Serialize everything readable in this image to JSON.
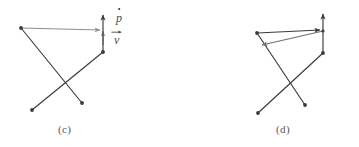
{
  "figure": {
    "background_color": "#ffffff",
    "panels": [
      {
        "id": "c",
        "caption": "(c)",
        "line_color": "#3a3a3e",
        "accent_color": "#8d8d92",
        "labels": [
          {
            "name": "p-dot",
            "base": "p",
            "accent": "dot",
            "x": 116,
            "y": 12
          },
          {
            "name": "v-vector",
            "base": "v",
            "accent": "arrow",
            "x": 114,
            "y": 34
          }
        ],
        "vertices": [
          {
            "name": "top-left-vertex",
            "x": 21,
            "y": 28
          },
          {
            "name": "right-mid-vertex",
            "x": 103,
            "y": 52
          },
          {
            "name": "lower-left-endpoint",
            "x": 32,
            "y": 110
          },
          {
            "name": "lower-right-endpoint",
            "x": 82,
            "y": 103
          },
          {
            "name": "arrow-origin",
            "x": 103,
            "y": 32
          }
        ],
        "arrows": [
          {
            "name": "horizontal-momentum-arrow",
            "from_x": 21,
            "from_y": 28,
            "to_x": 104,
            "to_y": 30,
            "color": "#8d8d92"
          },
          {
            "name": "vertical-velocity-arrow",
            "from_x": 103,
            "from_y": 52,
            "to_x": 103,
            "to_y": 11,
            "color": "#3a3a3e"
          },
          {
            "name": "short-vertical-accent-arrow",
            "from_x": 103,
            "from_y": 44,
            "to_x": 103,
            "to_y": 28,
            "color": "#8d8d92"
          }
        ]
      },
      {
        "id": "d",
        "caption": "(d)",
        "line_color": "#3a3a3e",
        "accent_color": "#6f6f74",
        "labels": [
          {
            "name": "q-dot",
            "base": "q",
            "accent": "dot",
            "x": 69,
            "y": 39
          }
        ],
        "vertices": [
          {
            "name": "top-left-vertex",
            "x": 77,
            "y": 33
          },
          {
            "name": "right-mid-vertex",
            "x": 143,
            "y": 53
          },
          {
            "name": "lower-left-endpoint",
            "x": 78,
            "y": 113
          },
          {
            "name": "lower-right-endpoint",
            "x": 125,
            "y": 105
          },
          {
            "name": "arrow-origin",
            "x": 143,
            "y": 31
          }
        ],
        "arrows": [
          {
            "name": "horizontal-top-arrow",
            "from_x": 77,
            "from_y": 33,
            "to_x": 144,
            "to_y": 30,
            "color": "#3a3a3e"
          },
          {
            "name": "diagonal-q-arrow",
            "from_x": 143,
            "from_y": 31,
            "to_x": 78,
            "to_y": 45,
            "color": "#6f6f74"
          },
          {
            "name": "vertical-velocity-arrow",
            "from_x": 143,
            "from_y": 53,
            "to_x": 143,
            "to_y": 10,
            "color": "#3a3a3e"
          }
        ]
      }
    ]
  }
}
